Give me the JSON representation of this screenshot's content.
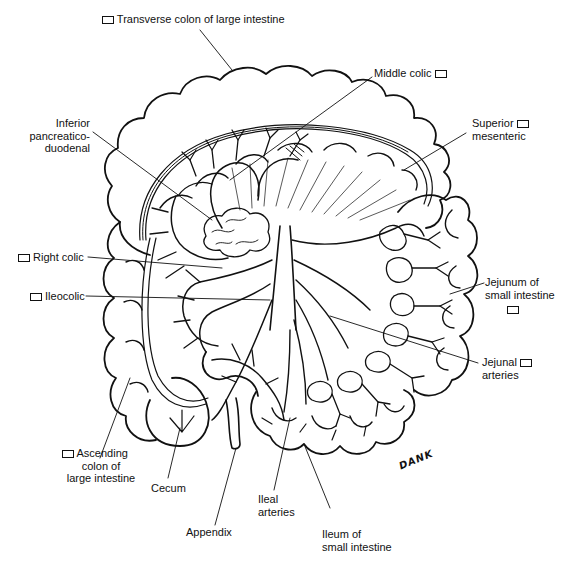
{
  "diagram": {
    "signature": "DANK",
    "labels": [
      {
        "id": "transverse-colon",
        "lines": [
          "Transverse colon of large intestine"
        ],
        "has_box": true,
        "box_position": "before"
      },
      {
        "id": "middle-colic",
        "lines": [
          "Middle colic"
        ],
        "has_box": true,
        "box_position": "after"
      },
      {
        "id": "inferior-pancreaticoduodenal",
        "lines": [
          "Inferior",
          "pancreatico-",
          "duodenal"
        ],
        "has_box": false
      },
      {
        "id": "superior-mesenteric",
        "lines": [
          "Superior",
          "mesenteric"
        ],
        "has_box": true,
        "box_position": "after-first-line"
      },
      {
        "id": "right-colic",
        "lines": [
          "Right colic"
        ],
        "has_box": true,
        "box_position": "before"
      },
      {
        "id": "ileocolic",
        "lines": [
          "Ileocolic"
        ],
        "has_box": true,
        "box_position": "before"
      },
      {
        "id": "jejunum",
        "lines": [
          "Jejunum of",
          "small intestine"
        ],
        "has_box": true,
        "box_position": "below"
      },
      {
        "id": "jejunal-arteries",
        "lines": [
          "Jejunal",
          "arteries"
        ],
        "has_box": true,
        "box_position": "after-first-line"
      },
      {
        "id": "ascending-colon",
        "lines": [
          "Ascending",
          "colon of",
          "large intestine"
        ],
        "has_box": true,
        "box_position": "before-first-line"
      },
      {
        "id": "cecum",
        "lines": [
          "Cecum"
        ],
        "has_box": false
      },
      {
        "id": "appendix",
        "lines": [
          "Appendix"
        ],
        "has_box": false
      },
      {
        "id": "ileal-arteries",
        "lines": [
          "Ileal",
          "arteries"
        ],
        "has_box": false
      },
      {
        "id": "ileum",
        "lines": [
          "Ileum of",
          "small intestine"
        ],
        "has_box": false
      }
    ]
  },
  "colors": {
    "ink": "#111111",
    "background": "#ffffff"
  }
}
